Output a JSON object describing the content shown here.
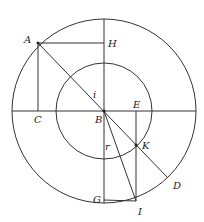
{
  "diagram": {
    "center": {
      "label": "B",
      "x": 104,
      "y": 111
    },
    "outer_circle": {
      "r": 92
    },
    "inner_circle": {
      "r": 48
    },
    "labels": {
      "A": "A",
      "H": "H",
      "C": "C",
      "B": "B",
      "E": "E",
      "K": "K",
      "D": "D",
      "G": "G",
      "I": "I",
      "i": "i",
      "r": "r"
    },
    "colors": {
      "stroke": "#333333",
      "text": "#222222",
      "background": "#ffffff"
    }
  }
}
